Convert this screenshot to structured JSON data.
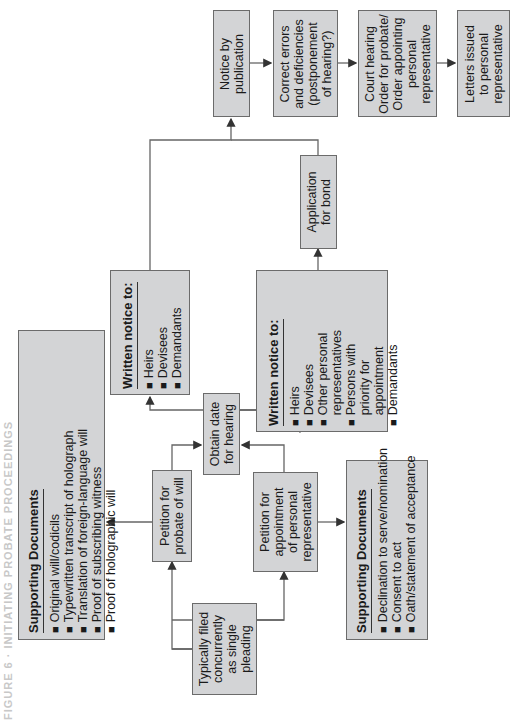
{
  "figure": {
    "title": "FIGURE 6 · INITIATING PROBATE PROCEEDINGS",
    "orientation": "rotated -90deg"
  },
  "nodes": {
    "supporting_docs_will": {
      "header": "Supporting Documents",
      "items": [
        "Original will/codicils",
        "Typewritten transcript of holograph",
        "Translation of foreign-language will",
        "Proof of subscribing witness",
        "Proof of holographic will"
      ]
    },
    "typically_filed": {
      "lines": [
        "Typically filed",
        "concurrently",
        "as single",
        "pleading"
      ]
    },
    "petition_probate": {
      "lines": [
        "Petition for",
        "probate of will"
      ]
    },
    "petition_appointment": {
      "lines": [
        "Petition for",
        "appointment",
        "of personal",
        "representative"
      ]
    },
    "obtain_date": {
      "lines": [
        "Obtain date",
        "for hearing"
      ]
    },
    "written_notice_1": {
      "header": "Written notice to:",
      "items": [
        "Heirs",
        "Devisees",
        "Demandants"
      ]
    },
    "written_notice_2": {
      "header": "Written notice to:",
      "items": [
        "Heirs",
        "Devisees",
        "Other personal",
        "representatives",
        "Persons with",
        "priority for",
        "appointment",
        "Demandants"
      ]
    },
    "supporting_docs_appointment": {
      "header": "Supporting Documents",
      "items": [
        "Declination to serve/nomination",
        "Consent to act",
        "Oath/statement of acceptance"
      ]
    },
    "application_bond": {
      "lines": [
        "Application",
        "for bond"
      ]
    },
    "notice_publication": {
      "lines": [
        "Notice by",
        "publication"
      ]
    },
    "correct_errors": {
      "lines": [
        "Correct errors",
        "and deficiencies",
        "(postponement",
        "of hearing?)"
      ]
    },
    "court_hearing": {
      "lines": [
        "Court hearing",
        "Order for probate/",
        "Order appointing",
        "personal",
        "representative"
      ]
    },
    "letters_issued": {
      "lines": [
        "Letters issued",
        "to personal",
        "representative"
      ]
    }
  },
  "colors": {
    "box_fill": "#d3d4d6",
    "box_border": "#6b6b6b",
    "line": "#555555",
    "text": "#1a1a1a"
  }
}
